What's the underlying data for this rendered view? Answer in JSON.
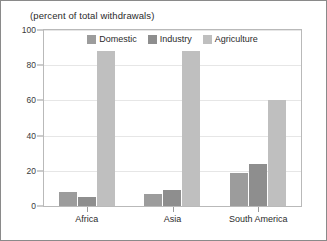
{
  "subtitle": "(percent of total withdrawals)",
  "chart_data": {
    "type": "bar",
    "title": "",
    "subtitle": "(percent of total withdrawals)",
    "xlabel": "",
    "ylabel": "",
    "ylim": [
      0,
      100
    ],
    "yticks": [
      0,
      20,
      40,
      60,
      80,
      100
    ],
    "grid": true,
    "legend_position": "top-center",
    "categories": [
      "Africa",
      "Asia",
      "South America"
    ],
    "series": [
      {
        "name": "Domestic",
        "color": "#9c9c9c",
        "values": [
          8,
          7,
          19
        ]
      },
      {
        "name": "Industry",
        "color": "#8e8e8e",
        "values": [
          5,
          9,
          24
        ]
      },
      {
        "name": "Agriculture",
        "color": "#bfbfbf",
        "values": [
          88,
          88,
          60
        ]
      }
    ]
  }
}
